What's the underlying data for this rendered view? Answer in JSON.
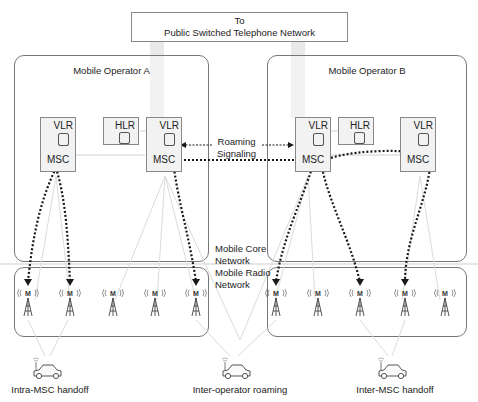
{
  "pstn": {
    "line1": "To",
    "line2": "Public Switched Telephone Network"
  },
  "operators": [
    {
      "title": "Mobile Operator A",
      "nodes": {
        "vlr": "VLR",
        "hlr": "HLR",
        "msc": "MSC"
      }
    },
    {
      "title": "Mobile Operator B",
      "nodes": {
        "vlr": "VLR",
        "hlr": "HLR",
        "msc": "MSC"
      }
    }
  ],
  "signaling": {
    "line1": "Roaming",
    "line2": "Signaling"
  },
  "layers": {
    "core": {
      "line1": "Mobile Core",
      "line2": "Network"
    },
    "radio": {
      "line1": "Mobile Radio",
      "line2": "Network"
    }
  },
  "tower_glyph": "M",
  "captions": {
    "intra": "Intra-MSC handoff",
    "inter_operator": "Inter-operator roaming",
    "inter_msc": "Inter-MSC handoff"
  },
  "colors": {
    "line": "#777777",
    "dotted": "#222222",
    "light_line": "#d6d6d6",
    "pstn_link": "#e6e6e6"
  }
}
